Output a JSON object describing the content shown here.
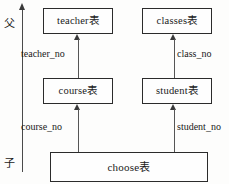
{
  "diagram": {
    "axis": {
      "top_label": "父",
      "bottom_label": "子",
      "icon": "up-arrow-axis"
    },
    "entities": [
      {
        "id": "teacher",
        "label": "teacher表",
        "name": "teacher",
        "suffix": "表"
      },
      {
        "id": "classes",
        "label": "classes表",
        "name": "classes",
        "suffix": "表"
      },
      {
        "id": "course",
        "label": "course表",
        "name": "course",
        "suffix": "表"
      },
      {
        "id": "student",
        "label": "student表",
        "name": "student",
        "suffix": "表"
      },
      {
        "id": "choose",
        "label": "choose表",
        "name": "choose",
        "suffix": "表"
      }
    ],
    "relations": [
      {
        "id": "teacher_no",
        "label": "teacher_no",
        "from": "course",
        "to": "teacher",
        "icon": "up-arrow-icon"
      },
      {
        "id": "class_no",
        "label": "class_no",
        "from": "student",
        "to": "classes",
        "icon": "up-arrow-icon"
      },
      {
        "id": "course_no",
        "label": "course_no",
        "from": "choose",
        "to": "course",
        "icon": "up-arrow-icon"
      },
      {
        "id": "student_no",
        "label": "student_no",
        "from": "choose",
        "to": "student",
        "icon": "up-arrow-icon"
      }
    ],
    "colors": {
      "background": "#fdfdfc",
      "box_border": "#2b2b2b",
      "box_fill": "#fefefe",
      "arrow": "#3a3a3a",
      "text": "#1a1a1a"
    }
  }
}
